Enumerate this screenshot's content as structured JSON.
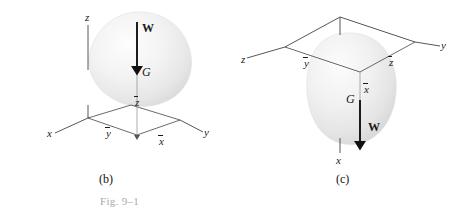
{
  "figure": {
    "caption": "Fig. 9–1",
    "caption_color": "#a9a9a9",
    "background": "#ffffff",
    "line_color": "#2b2b2b",
    "body_fill": "#ededed"
  },
  "panels": [
    {
      "id": "b",
      "label": "(b)",
      "description": "Rigid body above the x-y plane with weight W acting downward through centroid G",
      "axes": [
        {
          "name": "z-axis-label",
          "text": "z"
        },
        {
          "name": "x-axis-label",
          "text": "x"
        },
        {
          "name": "y-axis-label",
          "text": "y"
        }
      ],
      "dimensions": [
        {
          "name": "y-bar-label",
          "text": "y"
        },
        {
          "name": "x-bar-label",
          "text": "x"
        },
        {
          "name": "z-bar-label",
          "text": "z"
        }
      ],
      "centroid": {
        "name": "centroid-label",
        "text": "G"
      },
      "force": {
        "name": "weight-vector-label",
        "text": "W",
        "direction": "down"
      }
    },
    {
      "id": "c",
      "label": "(c)",
      "description": "Rigid body below the y-z plane with weight W acting downward along x through centroid G",
      "axes": [
        {
          "name": "z-axis-label",
          "text": "z"
        },
        {
          "name": "y-axis-label",
          "text": "y"
        },
        {
          "name": "x-axis-label",
          "text": "x"
        }
      ],
      "dimensions": [
        {
          "name": "y-bar-label",
          "text": "y"
        },
        {
          "name": "z-bar-label",
          "text": "z"
        },
        {
          "name": "x-bar-label",
          "text": "x"
        }
      ],
      "centroid": {
        "name": "centroid-label",
        "text": "G"
      },
      "force": {
        "name": "weight-vector-label",
        "text": "W",
        "direction": "down"
      }
    }
  ]
}
